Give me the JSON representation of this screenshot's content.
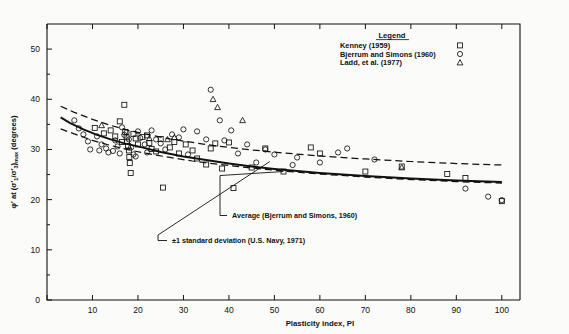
{
  "chart_data": {
    "type": "scatter",
    "title": "",
    "xlabel": "Plasticity index, PI",
    "ylabel": "φ' at (σ'₁/σ'₃)max (degrees)",
    "xlim": [
      0,
      104
    ],
    "ylim": [
      0,
      55
    ],
    "xticks": [
      0,
      10,
      20,
      30,
      40,
      50,
      60,
      70,
      80,
      90,
      100
    ],
    "yticks": [
      0,
      10,
      20,
      30,
      40,
      50
    ],
    "grid": false,
    "legend": {
      "title": "Legend",
      "position": "top-right-inside",
      "entries": [
        {
          "label": "Kenney (1959)",
          "marker": "square"
        },
        {
          "label": "Bjerrum and Simons (1960)",
          "marker": "circle"
        },
        {
          "label": "Ladd, et al. (1977)",
          "marker": "triangle"
        }
      ]
    },
    "annotations": [
      {
        "text": "Average (Bjerrum and Simons, 1960)",
        "target_x": 52,
        "target_y": 25.6
      },
      {
        "text": "±1 standard deviation (U.S. Navy, 1971)",
        "target_x": 49,
        "target_y": 27.6
      }
    ],
    "series": [
      {
        "name": "Average (Bjerrum and Simons, 1960)",
        "type": "line",
        "style": "solid",
        "points": [
          [
            3,
            36.4
          ],
          [
            5,
            35.3
          ],
          [
            8,
            34.0
          ],
          [
            11,
            32.9
          ],
          [
            14,
            32.0
          ],
          [
            17,
            31.2
          ],
          [
            20,
            30.6
          ],
          [
            25,
            29.5
          ],
          [
            30,
            28.6
          ],
          [
            35,
            27.9
          ],
          [
            40,
            27.2
          ],
          [
            45,
            26.6
          ],
          [
            50,
            26.1
          ],
          [
            60,
            25.3
          ],
          [
            70,
            24.7
          ],
          [
            80,
            24.2
          ],
          [
            90,
            23.8
          ],
          [
            100,
            23.5
          ]
        ]
      },
      {
        "name": "+1 standard deviation (U.S. Navy, 1971)",
        "type": "line",
        "style": "dashed",
        "points": [
          [
            3,
            38.6
          ],
          [
            6,
            37.4
          ],
          [
            10,
            36.0
          ],
          [
            14,
            34.8
          ],
          [
            18,
            33.8
          ],
          [
            22,
            33.0
          ],
          [
            27,
            32.1
          ],
          [
            32,
            31.4
          ],
          [
            38,
            30.6
          ],
          [
            45,
            29.9
          ],
          [
            52,
            29.3
          ],
          [
            60,
            28.7
          ],
          [
            70,
            28.1
          ],
          [
            80,
            27.6
          ],
          [
            90,
            27.2
          ],
          [
            100,
            26.9
          ]
        ]
      },
      {
        "name": "-1 standard deviation (U.S. Navy, 1971)",
        "type": "line",
        "style": "dashed",
        "points": [
          [
            3,
            34.1
          ],
          [
            6,
            33.1
          ],
          [
            10,
            31.8
          ],
          [
            14,
            30.8
          ],
          [
            18,
            29.9
          ],
          [
            22,
            29.2
          ],
          [
            27,
            28.4
          ],
          [
            32,
            27.7
          ],
          [
            38,
            27.0
          ],
          [
            45,
            26.3
          ],
          [
            52,
            25.7
          ],
          [
            60,
            25.1
          ],
          [
            70,
            24.5
          ],
          [
            80,
            24.0
          ],
          [
            90,
            23.6
          ],
          [
            100,
            23.3
          ]
        ]
      },
      {
        "name": "Kenney (1959)",
        "type": "scatter",
        "marker": "square",
        "points": [
          [
            10.5,
            34.3
          ],
          [
            12.5,
            33.2
          ],
          [
            14.0,
            33.8
          ],
          [
            15.0,
            32.6
          ],
          [
            16.0,
            35.6
          ],
          [
            16.5,
            31.5
          ],
          [
            17.0,
            38.9
          ],
          [
            17.2,
            33.5
          ],
          [
            17.5,
            32.4
          ],
          [
            17.6,
            31.6
          ],
          [
            17.8,
            30.7
          ],
          [
            18.0,
            29.8
          ],
          [
            18.1,
            28.5
          ],
          [
            18.2,
            27.3
          ],
          [
            18.4,
            25.3
          ],
          [
            19.0,
            33.1
          ],
          [
            19.5,
            32.2
          ],
          [
            20.0,
            31.0
          ],
          [
            21.0,
            32.5
          ],
          [
            22.0,
            32.8
          ],
          [
            22.5,
            31.3
          ],
          [
            23.0,
            30.1
          ],
          [
            24.0,
            29.6
          ],
          [
            25.0,
            32.1
          ],
          [
            25.5,
            22.4
          ],
          [
            27.0,
            30.4
          ],
          [
            28.0,
            31.5
          ],
          [
            29.0,
            29.2
          ],
          [
            30.5,
            31.0
          ],
          [
            32.0,
            29.8
          ],
          [
            33.0,
            28.2
          ],
          [
            35.0,
            27.0
          ],
          [
            36.0,
            30.2
          ],
          [
            37.0,
            31.2
          ],
          [
            38.5,
            26.2
          ],
          [
            40.0,
            31.4
          ],
          [
            41.0,
            22.3
          ],
          [
            45.0,
            26.4
          ],
          [
            48.0,
            30.2
          ],
          [
            52.0,
            25.6
          ],
          [
            58.0,
            30.4
          ],
          [
            60.0,
            29.2
          ],
          [
            70.0,
            25.6
          ],
          [
            78.0,
            26.6
          ],
          [
            88.0,
            25.1
          ],
          [
            92.0,
            24.3
          ],
          [
            100.0,
            19.7
          ]
        ]
      },
      {
        "name": "Bjerrum and Simons (1960)",
        "type": "scatter",
        "marker": "circle",
        "points": [
          [
            6.0,
            35.8
          ],
          [
            7.0,
            34.2
          ],
          [
            8.0,
            33.0
          ],
          [
            9.0,
            31.6
          ],
          [
            9.5,
            30.0
          ],
          [
            11.0,
            32.6
          ],
          [
            11.5,
            29.8
          ],
          [
            12.0,
            31.0
          ],
          [
            13.0,
            30.2
          ],
          [
            13.5,
            29.4
          ],
          [
            14.5,
            29.7
          ],
          [
            15.0,
            31.8
          ],
          [
            15.5,
            30.6
          ],
          [
            16.0,
            29.2
          ],
          [
            16.5,
            34.4
          ],
          [
            17.0,
            32.9
          ],
          [
            17.5,
            33.4
          ],
          [
            18.0,
            32.0
          ],
          [
            18.5,
            30.4
          ],
          [
            19.0,
            29.0
          ],
          [
            19.5,
            28.6
          ],
          [
            20.0,
            33.6
          ],
          [
            20.5,
            32.3
          ],
          [
            21.5,
            31.0
          ],
          [
            22.0,
            29.4
          ],
          [
            23.0,
            33.8
          ],
          [
            24.0,
            32.0
          ],
          [
            25.0,
            31.2
          ],
          [
            26.0,
            30.0
          ],
          [
            27.5,
            33.0
          ],
          [
            29.0,
            32.4
          ],
          [
            30.0,
            34.0
          ],
          [
            31.0,
            29.0
          ],
          [
            33.0,
            33.6
          ],
          [
            35.0,
            32.0
          ],
          [
            36.0,
            41.9
          ],
          [
            38.0,
            35.8
          ],
          [
            39.0,
            31.8
          ],
          [
            40.5,
            33.8
          ],
          [
            42.0,
            29.2
          ],
          [
            44.0,
            31.0
          ],
          [
            46.0,
            27.4
          ],
          [
            48.0,
            30.0
          ],
          [
            50.0,
            29.0
          ],
          [
            54.0,
            26.9
          ],
          [
            55.0,
            28.4
          ],
          [
            60.0,
            27.4
          ],
          [
            64.0,
            29.4
          ],
          [
            66.0,
            30.2
          ],
          [
            72.0,
            28.0
          ],
          [
            92.0,
            22.2
          ],
          [
            97.0,
            20.6
          ],
          [
            100.0,
            19.9
          ]
        ]
      },
      {
        "name": "Ladd, et al. (1977)",
        "type": "scatter",
        "marker": "triangle",
        "points": [
          [
            12.0,
            34.8
          ],
          [
            22.5,
            32.2
          ],
          [
            26.5,
            32.0
          ],
          [
            28.0,
            32.4
          ],
          [
            37.5,
            38.4
          ],
          [
            36.5,
            40.0
          ],
          [
            43.0,
            35.8
          ],
          [
            78.0,
            26.4
          ]
        ]
      }
    ]
  }
}
